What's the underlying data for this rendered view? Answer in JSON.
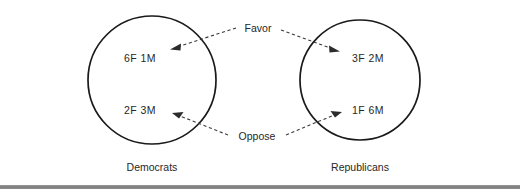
{
  "figure": {
    "background_color": "#ffffff",
    "stroke_color": "#1a1a1a",
    "text_color": "#272727",
    "connector_color": "#3a3a3a",
    "footer_rule_color": "#808080"
  },
  "groups": [
    {
      "id": "democrats",
      "caption": "Democrats",
      "center_x": 152,
      "center_y": 80,
      "radius": 64,
      "cells": [
        {
          "id": "dem-favor",
          "label": "6F  1M",
          "x": 140,
          "y": 58
        },
        {
          "id": "dem-oppose",
          "label": "2F  3M",
          "x": 140,
          "y": 110
        }
      ]
    },
    {
      "id": "republicans",
      "caption": "Republicans",
      "center_x": 360,
      "center_y": 80,
      "radius": 60,
      "cells": [
        {
          "id": "rep-favor",
          "label": "3F  2M",
          "x": 368,
          "y": 58
        },
        {
          "id": "rep-oppose",
          "label": "1F  6M",
          "x": 368,
          "y": 110
        }
      ]
    }
  ],
  "relations": [
    {
      "id": "favor",
      "label": "Favor",
      "label_x": 256,
      "label_y": 29,
      "targets": [
        "democrats",
        "republicans"
      ]
    },
    {
      "id": "oppose",
      "label": "Oppose",
      "label_x": 256,
      "label_y": 137,
      "targets": [
        "democrats",
        "republicans"
      ]
    }
  ],
  "captions": [
    {
      "id": "caption-democrats",
      "label": "Democrats",
      "x": 152,
      "y": 168
    },
    {
      "id": "caption-republicans",
      "label": "Republicans",
      "x": 360,
      "y": 168
    }
  ]
}
